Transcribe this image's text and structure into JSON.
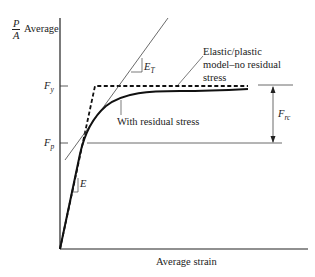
{
  "diagram": {
    "y_axis_label": {
      "fraction_numerator": "P",
      "fraction_denominator": "A",
      "text": "Average"
    },
    "x_axis_label": "Average strain",
    "ticks": {
      "fy": {
        "main": "F",
        "sub": "y"
      },
      "fp": {
        "main": "F",
        "sub": "p"
      }
    },
    "annotations": {
      "elastic_plastic_line1": "Elastic/plastic",
      "elastic_plastic_line2": "model–no residual",
      "elastic_plastic_line3": "stress",
      "with_residual": "With residual stress",
      "tangent_modulus": {
        "main": "E",
        "sub": "T"
      },
      "elastic_modulus": "E",
      "residual_dimension": {
        "main": "F",
        "sub": "rc"
      }
    },
    "colors": {
      "ink": "#222222",
      "thin_line": "#444444",
      "background": "#ffffff"
    }
  }
}
